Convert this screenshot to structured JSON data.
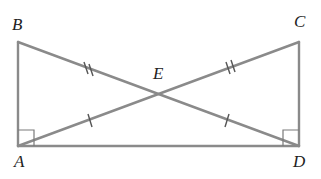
{
  "diagram": {
    "type": "geometry",
    "points": {
      "A": {
        "label": "A",
        "x": 18,
        "y": 146
      },
      "B": {
        "label": "B",
        "x": 18,
        "y": 42
      },
      "C": {
        "label": "C",
        "x": 299,
        "y": 42
      },
      "D": {
        "label": "D",
        "x": 299,
        "y": 146
      },
      "E": {
        "label": "E",
        "x": 160,
        "y": 94
      }
    },
    "segments": [
      "AB",
      "AD",
      "CD",
      "BD",
      "AC"
    ],
    "equal_marks": {
      "double": [
        "BE",
        "CE"
      ],
      "single": [
        "AE",
        "DE"
      ]
    },
    "right_angles": [
      "A",
      "D"
    ],
    "line_color": "#8a8a8a"
  }
}
